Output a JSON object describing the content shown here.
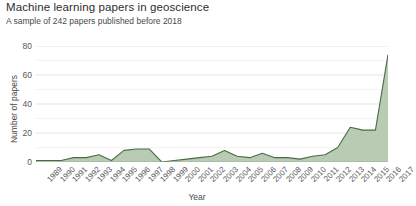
{
  "chart_data": {
    "type": "area",
    "title": "Machine learning papers in geoscience",
    "subtitle": "A sample of 242 papers published before 2018",
    "xlabel": "Year",
    "ylabel": "Number of papers",
    "xlim": [
      1989,
      2017
    ],
    "ylim": [
      0,
      80
    ],
    "yticks": [
      0,
      20,
      40,
      60,
      80
    ],
    "ytick_labels": [
      "0",
      "20",
      "40",
      "60",
      "80"
    ],
    "minor_yticks": [
      10,
      30,
      50,
      70
    ],
    "grid": true,
    "legend": null,
    "line_color": "#4a6b48",
    "fill_color": "#b9cbb3",
    "categories": [
      "1989",
      "1990",
      "1991",
      "1992",
      "1993",
      "1994",
      "1995",
      "1996",
      "1997",
      "1998",
      "1999",
      "2000",
      "2001",
      "2002",
      "2003",
      "2004",
      "2005",
      "2006",
      "2007",
      "2008",
      "2009",
      "2010",
      "2011",
      "2012",
      "2013",
      "2014",
      "2015",
      "2016",
      "2017"
    ],
    "values": [
      1,
      1,
      1,
      3,
      3,
      5,
      1,
      8,
      9,
      9,
      0,
      1,
      2,
      3,
      4,
      8,
      4,
      3,
      6,
      3,
      3,
      2,
      4,
      5,
      10,
      24,
      22,
      22,
      74
    ]
  }
}
